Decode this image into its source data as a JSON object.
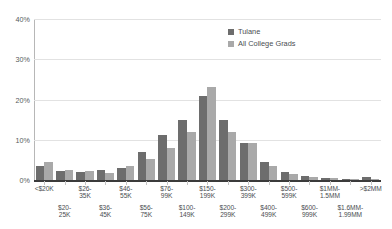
{
  "chart_data": {
    "type": "bar",
    "title": "",
    "xlabel": "",
    "ylabel": "",
    "ylim": [
      0,
      40
    ],
    "yticks": [
      "0%",
      "10%",
      "20%",
      "30%",
      "40%"
    ],
    "ytick_values": [
      0,
      10,
      20,
      30,
      40
    ],
    "grid": true,
    "legend_position": "top-center-right",
    "categories": [
      "<$20K",
      "$20-\n25K",
      "$26-\n35K",
      "$36-\n45K",
      "$46-\n55K",
      "$56-\n75K",
      "$76-\n99K",
      "$100-\n149K",
      "$150-\n199K",
      "$200-\n299K",
      "$300-\n399K",
      "$400-\n499K",
      "$500-\n599K",
      "$600-\n999K",
      "$1MM-\n1.5MM",
      "$1.6MM-\n1.99MM",
      ">$2MM"
    ],
    "category_rows": [
      0,
      1,
      0,
      1,
      0,
      1,
      0,
      1,
      0,
      1,
      0,
      1,
      0,
      1,
      0,
      1,
      0
    ],
    "series": [
      {
        "name": "Tulane",
        "color": "#6d6d6d",
        "values": [
          3.4,
          2.2,
          2.0,
          2.6,
          3.1,
          7.0,
          11.1,
          14.8,
          20.8,
          14.9,
          9.2,
          4.4,
          2.0,
          1.1,
          0.5,
          0.3,
          0.7
        ]
      },
      {
        "name": "All College Grads",
        "color": "#a9a9a9",
        "values": [
          4.4,
          2.6,
          2.2,
          1.7,
          3.5,
          5.1,
          8.0,
          12.0,
          23.0,
          11.9,
          9.2,
          3.5,
          1.5,
          0.8,
          0.4,
          0.2,
          0.3
        ]
      }
    ]
  },
  "legend": {
    "items": [
      {
        "label": "Tulane",
        "color": "#6d6d6d"
      },
      {
        "label": "All College Grads",
        "color": "#a9a9a9"
      }
    ]
  }
}
